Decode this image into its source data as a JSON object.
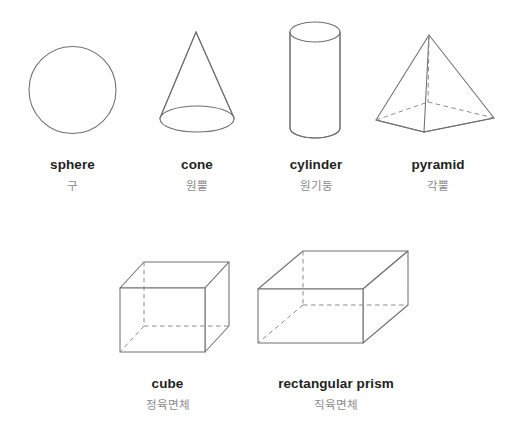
{
  "page": {
    "background": "#ffffff",
    "width": 510,
    "height": 423,
    "line_color": "#6f7072",
    "label_en_color": "#231f20",
    "label_ko_color": "#8a8a8a"
  },
  "rows": [
    {
      "row_name": "curved-and-pyramid-solids",
      "items": [
        {
          "key": "sphere",
          "label_en": "sphere",
          "label_ko": "구",
          "icon": "sphere-figure"
        },
        {
          "key": "cone",
          "label_en": "cone",
          "label_ko": "원뿔",
          "icon": "cone-figure"
        },
        {
          "key": "cylinder",
          "label_en": "cylinder",
          "label_ko": "원기둥",
          "icon": "cylinder-figure"
        },
        {
          "key": "pyramid",
          "label_en": "pyramid",
          "label_ko": "각뿔",
          "icon": "pyramid-figure"
        }
      ]
    },
    {
      "row_name": "prism-solids",
      "items": [
        {
          "key": "cube",
          "label_en": "cube",
          "label_ko": "정육면체",
          "icon": "cube-figure"
        },
        {
          "key": "rectangular-prism",
          "label_en": "rectangular prism",
          "label_ko": "직육면체",
          "icon": "rectangular-prism-figure"
        }
      ]
    }
  ]
}
